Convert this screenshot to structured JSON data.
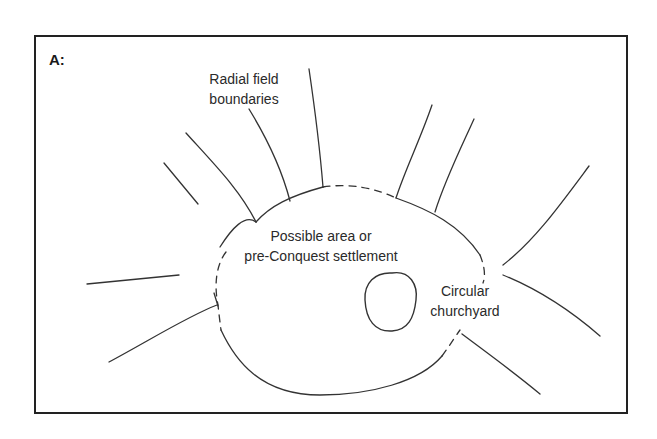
{
  "figure": {
    "panel_label": "A:",
    "colors": {
      "background": "#ffffff",
      "line": "#222222",
      "text": "#2a2a2a"
    },
    "frame": {
      "x1": 35,
      "y1": 36,
      "x2": 627,
      "y2": 413
    }
  },
  "labels": {
    "radial": {
      "line1": "Radial field",
      "line2": "boundaries"
    },
    "settlement": {
      "line1": "Possible area or",
      "line2": "pre-Conquest settlement"
    },
    "churchyard": {
      "line1": "Circular",
      "line2": "churchyard"
    }
  },
  "shapes": {
    "settlement_solid": [
      "M 220 247 C 232 228, 245 214, 256 222",
      "M 256 222 C 270 206, 290 196, 323 187",
      "M 396 198 C 430 210, 460 225, 480 255",
      "M 221 330 C 235 360, 260 395, 320 395 C 370 395, 420 382, 442 356",
      "M 214 293 L 218 306"
    ],
    "settlement_dashed": [
      "M 323 187 C 350 183, 375 188, 396 198",
      "M 480 255 C 484 265, 486 275, 483 283",
      "M 442 356 C 450 345, 455 337, 460 330",
      "M 226 252 C 216 265, 214 285, 218 305 C 219 315, 220 322, 221 330"
    ],
    "churchyard": "M 392 273 C 410 270, 418 285, 416 300 C 414 318, 408 330, 392 331 C 375 332, 366 320, 365 300 C 364 283, 375 272, 392 273 Z",
    "radials": [
      "M 164 163 L 198 204",
      "M 186 133 C 215 165, 240 190, 256 222",
      "M 249 109 C 268 140, 282 170, 290 201",
      "M 309 69 C 315 110, 320 150, 323 187",
      "M 432 105 C 420 140, 405 170, 396 198",
      "M 474 119 C 460 150, 445 180, 435 212",
      "M 589 166 C 560 205, 535 240, 503 265",
      "M 503 275 C 540 290, 570 310, 600 336",
      "M 87 284 L 179 275",
      "M 109 362 C 150 340, 190 315, 217 305",
      "M 462 334 C 490 355, 515 373, 540 394"
    ]
  }
}
